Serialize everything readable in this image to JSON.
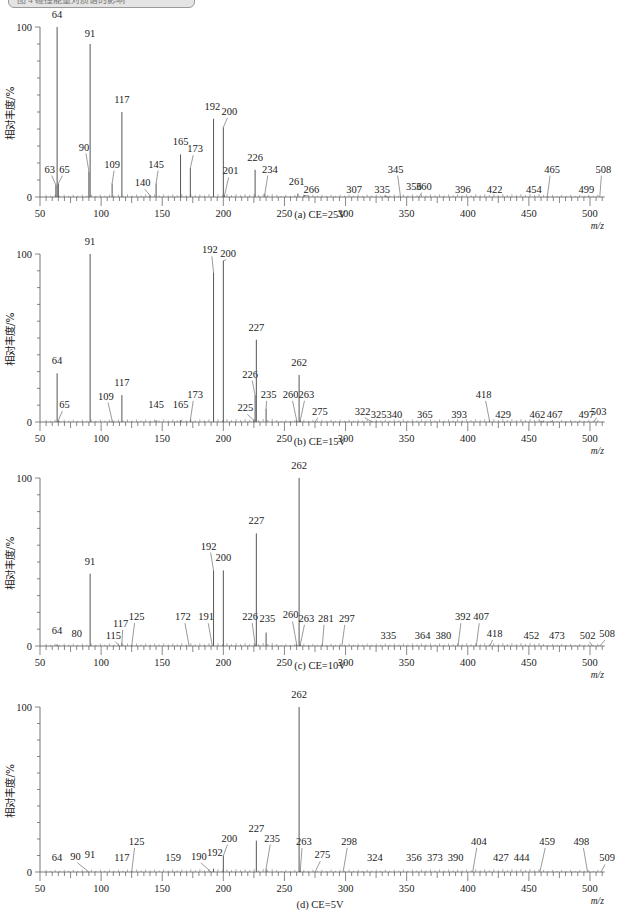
{
  "header": {
    "text": "图 4 碰撞能量对质谱的影响"
  },
  "chart_data": [
    {
      "type": "bar",
      "subtype": "mass-spectrum-stick",
      "title": "(a) CE=25V",
      "xlabel": "m/z",
      "ylabel": "相对丰度/%",
      "xlim": [
        50,
        512
      ],
      "ylim": [
        0,
        100
      ],
      "xticks": [
        50,
        100,
        150,
        200,
        250,
        300,
        350,
        400,
        450,
        500
      ],
      "yticks": [
        0,
        100
      ],
      "grid": false,
      "peaks": [
        {
          "mz": 63,
          "intensity": 7,
          "label": "63",
          "lx": 58,
          "ly": 12
        },
        {
          "mz": 64,
          "intensity": 100,
          "label": "64",
          "lx": 64,
          "ly": 103
        },
        {
          "mz": 65,
          "intensity": 8,
          "label": "65",
          "lx": 70,
          "ly": 12
        },
        {
          "mz": 90,
          "intensity": 15,
          "label": "90",
          "lx": 86,
          "ly": 25
        },
        {
          "mz": 91,
          "intensity": 90,
          "label": "91",
          "lx": 91,
          "ly": 92
        },
        {
          "mz": 109,
          "intensity": 8,
          "label": "109",
          "lx": 109,
          "ly": 15
        },
        {
          "mz": 117,
          "intensity": 50,
          "label": "117",
          "lx": 117,
          "ly": 53
        },
        {
          "mz": 140,
          "intensity": 1,
          "label": "140",
          "lx": 134,
          "ly": 4
        },
        {
          "mz": 145,
          "intensity": 8,
          "label": "145",
          "lx": 145,
          "ly": 15
        },
        {
          "mz": 165,
          "intensity": 25,
          "label": "165",
          "lx": 165,
          "ly": 28
        },
        {
          "mz": 173,
          "intensity": 17,
          "label": "173",
          "lx": 177,
          "ly": 24
        },
        {
          "mz": 192,
          "intensity": 46,
          "label": "192",
          "lx": 191,
          "ly": 49
        },
        {
          "mz": 200,
          "intensity": 41,
          "label": "200",
          "lx": 205,
          "ly": 46
        },
        {
          "mz": 201,
          "intensity": 1,
          "label": "201",
          "lx": 206,
          "ly": 11
        },
        {
          "mz": 226,
          "intensity": 16,
          "label": "226",
          "lx": 226,
          "ly": 19
        },
        {
          "mz": 234,
          "intensity": 2,
          "label": "234",
          "lx": 238,
          "ly": 12
        },
        {
          "mz": 261,
          "intensity": 2,
          "label": "261",
          "lx": 260,
          "ly": 5
        },
        {
          "mz": 266,
          "intensity": 1,
          "label": "266",
          "lx": 272,
          "ly": 0
        },
        {
          "mz": 307,
          "intensity": 0,
          "label": "307",
          "lx": 307,
          "ly": 0
        },
        {
          "mz": 335,
          "intensity": 0,
          "label": "335",
          "lx": 330,
          "ly": 0
        },
        {
          "mz": 345,
          "intensity": 0,
          "label": "345",
          "lx": 341,
          "ly": 12
        },
        {
          "mz": 356,
          "intensity": 0,
          "label": "356",
          "lx": 356,
          "ly": 2
        },
        {
          "mz": 360,
          "intensity": 0,
          "label": "360",
          "lx": 364,
          "ly": 2
        },
        {
          "mz": 396,
          "intensity": 0,
          "label": "396",
          "lx": 396,
          "ly": 0
        },
        {
          "mz": 422,
          "intensity": 0,
          "label": "422",
          "lx": 422,
          "ly": 0
        },
        {
          "mz": 454,
          "intensity": 0,
          "label": "454",
          "lx": 454,
          "ly": 0
        },
        {
          "mz": 465,
          "intensity": 0,
          "label": "465",
          "lx": 469,
          "ly": 12
        },
        {
          "mz": 499,
          "intensity": 0,
          "label": "499",
          "lx": 497,
          "ly": 0
        },
        {
          "mz": 508,
          "intensity": 0,
          "label": "508",
          "lx": 511,
          "ly": 12
        }
      ]
    },
    {
      "type": "bar",
      "subtype": "mass-spectrum-stick",
      "title": "(b) CE=15V",
      "xlabel": "m/z",
      "ylabel": "相对丰度/%",
      "xlim": [
        50,
        512
      ],
      "ylim": [
        0,
        100
      ],
      "xticks": [
        50,
        100,
        150,
        200,
        250,
        300,
        350,
        400,
        450,
        500
      ],
      "yticks": [
        0,
        100
      ],
      "grid": false,
      "peaks": [
        {
          "mz": 64,
          "intensity": 29,
          "label": "64",
          "lx": 64,
          "ly": 32
        },
        {
          "mz": 65,
          "intensity": 1,
          "label": "65",
          "lx": 70,
          "ly": 6
        },
        {
          "mz": 91,
          "intensity": 100,
          "label": "91",
          "lx": 91,
          "ly": 103
        },
        {
          "mz": 109,
          "intensity": 1,
          "label": "109",
          "lx": 104,
          "ly": 11
        },
        {
          "mz": 117,
          "intensity": 16,
          "label": "117",
          "lx": 117,
          "ly": 19
        },
        {
          "mz": 145,
          "intensity": 1,
          "label": "145",
          "lx": 145,
          "ly": 6
        },
        {
          "mz": 165,
          "intensity": 1,
          "label": "165",
          "lx": 165,
          "ly": 6
        },
        {
          "mz": 173,
          "intensity": 1,
          "label": "173",
          "lx": 177,
          "ly": 12
        },
        {
          "mz": 192,
          "intensity": 89,
          "label": "192",
          "lx": 189,
          "ly": 98
        },
        {
          "mz": 200,
          "intensity": 96,
          "label": "200",
          "lx": 204,
          "ly": 96
        },
        {
          "mz": 225,
          "intensity": 1,
          "label": "225",
          "lx": 218,
          "ly": 4
        },
        {
          "mz": 226,
          "intensity": 16,
          "label": "226",
          "lx": 222,
          "ly": 24
        },
        {
          "mz": 227,
          "intensity": 49,
          "label": "227",
          "lx": 227,
          "ly": 52
        },
        {
          "mz": 235,
          "intensity": 8,
          "label": "235",
          "lx": 237,
          "ly": 12
        },
        {
          "mz": 260,
          "intensity": 1,
          "label": "260",
          "lx": 255,
          "ly": 12
        },
        {
          "mz": 262,
          "intensity": 28,
          "label": "262",
          "lx": 262,
          "ly": 31
        },
        {
          "mz": 263,
          "intensity": 1,
          "label": "263",
          "lx": 268,
          "ly": 12
        },
        {
          "mz": 275,
          "intensity": 0,
          "label": "275",
          "lx": 279,
          "ly": 2
        },
        {
          "mz": 322,
          "intensity": 0,
          "label": "322",
          "lx": 314,
          "ly": 2
        },
        {
          "mz": 325,
          "intensity": 0,
          "label": "325",
          "lx": 327,
          "ly": 0
        },
        {
          "mz": 340,
          "intensity": 0,
          "label": "340",
          "lx": 340,
          "ly": 0
        },
        {
          "mz": 365,
          "intensity": 0,
          "label": "365",
          "lx": 365,
          "ly": 0
        },
        {
          "mz": 393,
          "intensity": 0,
          "label": "393",
          "lx": 393,
          "ly": 0
        },
        {
          "mz": 418,
          "intensity": 0,
          "label": "418",
          "lx": 413,
          "ly": 12
        },
        {
          "mz": 429,
          "intensity": 0,
          "label": "429",
          "lx": 429,
          "ly": 0
        },
        {
          "mz": 462,
          "intensity": 0,
          "label": "462",
          "lx": 457,
          "ly": 0
        },
        {
          "mz": 467,
          "intensity": 0,
          "label": "467",
          "lx": 471,
          "ly": 0
        },
        {
          "mz": 497,
          "intensity": 0,
          "label": "497",
          "lx": 497,
          "ly": 0
        },
        {
          "mz": 503,
          "intensity": 0,
          "label": "503",
          "lx": 507,
          "ly": 2
        }
      ]
    },
    {
      "type": "bar",
      "subtype": "mass-spectrum-stick",
      "title": "(c) CE=10V",
      "xlabel": "m/z",
      "ylabel": "相对丰度/%",
      "xlim": [
        50,
        512
      ],
      "ylim": [
        0,
        100
      ],
      "xticks": [
        50,
        100,
        150,
        200,
        250,
        300,
        350,
        400,
        450,
        500
      ],
      "yticks": [
        0,
        100
      ],
      "grid": false,
      "peaks": [
        {
          "mz": 64,
          "intensity": 1,
          "label": "64",
          "lx": 64,
          "ly": 5
        },
        {
          "mz": 80,
          "intensity": 0,
          "label": "80",
          "lx": 80,
          "ly": 3
        },
        {
          "mz": 91,
          "intensity": 43,
          "label": "91",
          "lx": 91,
          "ly": 46
        },
        {
          "mz": 115,
          "intensity": 0,
          "label": "115",
          "lx": 110,
          "ly": 2
        },
        {
          "mz": 117,
          "intensity": 2,
          "label": "117",
          "lx": 116,
          "ly": 9
        },
        {
          "mz": 125,
          "intensity": 0,
          "label": "125",
          "lx": 129,
          "ly": 13
        },
        {
          "mz": 172,
          "intensity": 0,
          "label": "172",
          "lx": 167,
          "ly": 13
        },
        {
          "mz": 191,
          "intensity": 0,
          "label": "191",
          "lx": 186,
          "ly": 13
        },
        {
          "mz": 192,
          "intensity": 45,
          "label": "192",
          "lx": 188,
          "ly": 55
        },
        {
          "mz": 200,
          "intensity": 45,
          "label": "200",
          "lx": 200,
          "ly": 48
        },
        {
          "mz": 226,
          "intensity": 1,
          "label": "226",
          "lx": 222,
          "ly": 13
        },
        {
          "mz": 227,
          "intensity": 67,
          "label": "227",
          "lx": 227,
          "ly": 70
        },
        {
          "mz": 235,
          "intensity": 8,
          "label": "235",
          "lx": 236,
          "ly": 12
        },
        {
          "mz": 260,
          "intensity": 1,
          "label": "260",
          "lx": 255,
          "ly": 14
        },
        {
          "mz": 262,
          "intensity": 100,
          "label": "262",
          "lx": 262,
          "ly": 103
        },
        {
          "mz": 263,
          "intensity": 1,
          "label": "263",
          "lx": 268,
          "ly": 12
        },
        {
          "mz": 281,
          "intensity": 0,
          "label": "281",
          "lx": 284,
          "ly": 12
        },
        {
          "mz": 297,
          "intensity": 0,
          "label": "297",
          "lx": 301,
          "ly": 12
        },
        {
          "mz": 335,
          "intensity": 0,
          "label": "335",
          "lx": 335,
          "ly": 2
        },
        {
          "mz": 364,
          "intensity": 0,
          "label": "364",
          "lx": 363,
          "ly": 2
        },
        {
          "mz": 380,
          "intensity": 0,
          "label": "380",
          "lx": 380,
          "ly": 2
        },
        {
          "mz": 392,
          "intensity": 0,
          "label": "392",
          "lx": 396,
          "ly": 13
        },
        {
          "mz": 407,
          "intensity": 0,
          "label": "407",
          "lx": 411,
          "ly": 13
        },
        {
          "mz": 418,
          "intensity": 0,
          "label": "418",
          "lx": 422,
          "ly": 3
        },
        {
          "mz": 452,
          "intensity": 0,
          "label": "452",
          "lx": 452,
          "ly": 2
        },
        {
          "mz": 473,
          "intensity": 0,
          "label": "473",
          "lx": 473,
          "ly": 2
        },
        {
          "mz": 502,
          "intensity": 0,
          "label": "502",
          "lx": 498,
          "ly": 2
        },
        {
          "mz": 508,
          "intensity": 0,
          "label": "508",
          "lx": 514,
          "ly": 3
        }
      ]
    },
    {
      "type": "bar",
      "subtype": "mass-spectrum-stick",
      "title": "(d) CE=5V",
      "xlabel": "m/z",
      "ylabel": "相对丰度/%",
      "xlim": [
        50,
        512
      ],
      "ylim": [
        0,
        100
      ],
      "xticks": [
        50,
        100,
        150,
        200,
        250,
        300,
        350,
        400,
        450,
        500
      ],
      "yticks": [
        0,
        100
      ],
      "grid": false,
      "peaks": [
        {
          "mz": 64,
          "intensity": 0,
          "label": "64",
          "lx": 64,
          "ly": 4
        },
        {
          "mz": 90,
          "intensity": 0,
          "label": "90",
          "lx": 79,
          "ly": 5
        },
        {
          "mz": 91,
          "intensity": 0,
          "label": "91",
          "lx": 91,
          "ly": 6
        },
        {
          "mz": 117,
          "intensity": 0,
          "label": "117",
          "lx": 117,
          "ly": 4
        },
        {
          "mz": 125,
          "intensity": 0,
          "label": "125",
          "lx": 129,
          "ly": 14
        },
        {
          "mz": 159,
          "intensity": 0,
          "label": "159",
          "lx": 159,
          "ly": 4
        },
        {
          "mz": 190,
          "intensity": 0,
          "label": "190",
          "lx": 180,
          "ly": 5
        },
        {
          "mz": 192,
          "intensity": 2,
          "label": "192",
          "lx": 193,
          "ly": 7
        },
        {
          "mz": 200,
          "intensity": 10,
          "label": "200",
          "lx": 205,
          "ly": 16
        },
        {
          "mz": 227,
          "intensity": 19,
          "label": "227",
          "lx": 227,
          "ly": 22
        },
        {
          "mz": 235,
          "intensity": 2,
          "label": "235",
          "lx": 240,
          "ly": 16
        },
        {
          "mz": 262,
          "intensity": 100,
          "label": "262",
          "lx": 262,
          "ly": 103
        },
        {
          "mz": 263,
          "intensity": 1,
          "label": "263",
          "lx": 266,
          "ly": 14
        },
        {
          "mz": 275,
          "intensity": 0,
          "label": "275",
          "lx": 281,
          "ly": 6
        },
        {
          "mz": 298,
          "intensity": 0,
          "label": "298",
          "lx": 303,
          "ly": 14
        },
        {
          "mz": 324,
          "intensity": 0,
          "label": "324",
          "lx": 324,
          "ly": 4
        },
        {
          "mz": 356,
          "intensity": 0,
          "label": "356",
          "lx": 356,
          "ly": 4
        },
        {
          "mz": 373,
          "intensity": 0,
          "label": "373",
          "lx": 373,
          "ly": 4
        },
        {
          "mz": 390,
          "intensity": 0,
          "label": "390",
          "lx": 390,
          "ly": 4
        },
        {
          "mz": 404,
          "intensity": 0,
          "label": "404",
          "lx": 409,
          "ly": 14
        },
        {
          "mz": 427,
          "intensity": 0,
          "label": "427",
          "lx": 427,
          "ly": 4
        },
        {
          "mz": 444,
          "intensity": 0,
          "label": "444",
          "lx": 444,
          "ly": 4
        },
        {
          "mz": 459,
          "intensity": 0,
          "label": "459",
          "lx": 465,
          "ly": 14
        },
        {
          "mz": 498,
          "intensity": 0,
          "label": "498",
          "lx": 493,
          "ly": 14
        },
        {
          "mz": 509,
          "intensity": 0,
          "label": "509",
          "lx": 514,
          "ly": 4
        }
      ]
    }
  ],
  "layout": {
    "x0_px": 40,
    "px_per_unit": 1.2222,
    "axis_end_mz": 512,
    "panels": [
      {
        "top": 27,
        "bottom": 197,
        "caption_y": 218
      },
      {
        "top": 254,
        "bottom": 422,
        "caption_y": 445
      },
      {
        "top": 478,
        "bottom": 646,
        "caption_y": 669
      },
      {
        "top": 707,
        "bottom": 872,
        "caption_y": 908
      }
    ],
    "line_color": "#555555"
  }
}
